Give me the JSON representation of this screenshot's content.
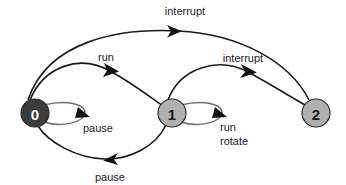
{
  "diagram": {
    "type": "state-transition-diagram",
    "background_color": "#ffffff",
    "edge_color": "#1a1a1a",
    "loop_color": "#6f6f6f",
    "states": [
      {
        "id": "0",
        "label": "0",
        "cx": 35,
        "cy": 113,
        "r": 14,
        "fill": "#3b3b3b",
        "stroke": "#2a2a2a",
        "text_color": "#ffffff"
      },
      {
        "id": "1",
        "label": "1",
        "cx": 172,
        "cy": 113,
        "r": 14,
        "fill": "#b0b0b0",
        "stroke": "#2a2a2a",
        "text_color": "#1b1b1b"
      },
      {
        "id": "2",
        "label": "2",
        "cx": 316,
        "cy": 113,
        "r": 14,
        "fill": "#b0b0b0",
        "stroke": "#2a2a2a",
        "text_color": "#1b1b1b"
      }
    ],
    "transitions": [
      {
        "id": "t0-2-interrupt",
        "from": "0",
        "to": "2",
        "label": "interrupt",
        "label_x": 185,
        "label_y": 15,
        "kind": "arc-top"
      },
      {
        "id": "t0-1-run",
        "from": "0",
        "to": "1",
        "label": "run",
        "label_x": 106,
        "label_y": 61,
        "kind": "arc-upper"
      },
      {
        "id": "t1-2-interrupt",
        "from": "1",
        "to": "2",
        "label": "interrupt",
        "label_x": 243,
        "label_y": 62,
        "kind": "arc-upper"
      },
      {
        "id": "t0-0-pause",
        "from": "0",
        "to": "0",
        "label": "pause",
        "label_x": 95,
        "label_y": 130,
        "kind": "self-loop"
      },
      {
        "id": "t1-1-run-rotate",
        "from": "1",
        "to": "1",
        "label": "run\nrotate",
        "label_line1": "run",
        "label_line2": "rotate",
        "label_x": 232,
        "label_y": 129,
        "kind": "self-loop"
      },
      {
        "id": "t1-0-pause",
        "from": "1",
        "to": "0",
        "label": "pause",
        "label_x": 110,
        "label_y": 181,
        "kind": "arc-lower"
      }
    ]
  }
}
